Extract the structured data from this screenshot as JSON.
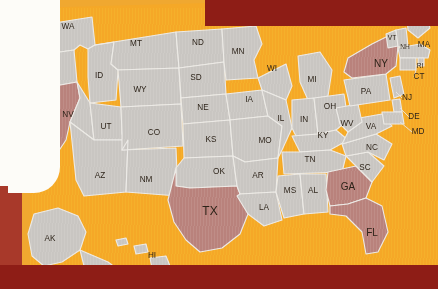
{
  "map": {
    "title": "United States map with highlighted states",
    "colors": {
      "background_orange": "#f5a827",
      "state_fill": "#c9c6c2",
      "state_highlight": "#b9827c",
      "state_border": "#eceae6",
      "frame_red": "#8e1d16",
      "frame_red_left": "#a8392a",
      "panel_white": "#fdfcf8",
      "label_text": "#2b2218"
    },
    "highlighted_states": [
      "CA",
      "TX",
      "NY",
      "GA",
      "FL"
    ],
    "states": [
      {
        "code": "WA",
        "x": 68,
        "y": 27,
        "size": "normal",
        "highlighted": false
      },
      {
        "code": "OR",
        "x": 47,
        "y": 64,
        "size": "normal",
        "highlighted": false
      },
      {
        "code": "CA",
        "x": 45,
        "y": 143,
        "size": "big",
        "highlighted": true
      },
      {
        "code": "NV",
        "x": 68,
        "y": 115,
        "size": "normal",
        "highlighted": false
      },
      {
        "code": "ID",
        "x": 99,
        "y": 76,
        "size": "normal",
        "highlighted": false
      },
      {
        "code": "MT",
        "x": 136,
        "y": 44,
        "size": "normal",
        "highlighted": false
      },
      {
        "code": "WY",
        "x": 140,
        "y": 90,
        "size": "normal",
        "highlighted": false
      },
      {
        "code": "UT",
        "x": 106,
        "y": 127,
        "size": "normal",
        "highlighted": false
      },
      {
        "code": "CO",
        "x": 154,
        "y": 133,
        "size": "normal",
        "highlighted": false
      },
      {
        "code": "AZ",
        "x": 100,
        "y": 176,
        "size": "normal",
        "highlighted": false
      },
      {
        "code": "NM",
        "x": 146,
        "y": 180,
        "size": "normal",
        "highlighted": false
      },
      {
        "code": "ND",
        "x": 198,
        "y": 43,
        "size": "normal",
        "highlighted": false
      },
      {
        "code": "SD",
        "x": 196,
        "y": 78,
        "size": "normal",
        "highlighted": false
      },
      {
        "code": "NE",
        "x": 203,
        "y": 108,
        "size": "normal",
        "highlighted": false
      },
      {
        "code": "KS",
        "x": 211,
        "y": 140,
        "size": "normal",
        "highlighted": false
      },
      {
        "code": "OK",
        "x": 219,
        "y": 172,
        "size": "normal",
        "highlighted": false
      },
      {
        "code": "TX",
        "x": 210,
        "y": 212,
        "size": "big",
        "highlighted": true
      },
      {
        "code": "MN",
        "x": 238,
        "y": 52,
        "size": "normal",
        "highlighted": false
      },
      {
        "code": "IA",
        "x": 249,
        "y": 100,
        "size": "normal",
        "highlighted": false
      },
      {
        "code": "MO",
        "x": 265,
        "y": 141,
        "size": "normal",
        "highlighted": false
      },
      {
        "code": "AR",
        "x": 258,
        "y": 176,
        "size": "normal",
        "highlighted": false
      },
      {
        "code": "LA",
        "x": 264,
        "y": 208,
        "size": "normal",
        "highlighted": false
      },
      {
        "code": "WI",
        "x": 272,
        "y": 69,
        "size": "normal",
        "highlighted": false
      },
      {
        "code": "IL",
        "x": 281,
        "y": 119,
        "size": "normal",
        "highlighted": false
      },
      {
        "code": "MS",
        "x": 290,
        "y": 191,
        "size": "normal",
        "highlighted": false
      },
      {
        "code": "MI",
        "x": 312,
        "y": 80,
        "size": "normal",
        "highlighted": false
      },
      {
        "code": "IN",
        "x": 304,
        "y": 120,
        "size": "normal",
        "highlighted": false
      },
      {
        "code": "OH",
        "x": 330,
        "y": 107,
        "size": "normal",
        "highlighted": false
      },
      {
        "code": "KY",
        "x": 323,
        "y": 136,
        "size": "normal",
        "highlighted": false
      },
      {
        "code": "TN",
        "x": 310,
        "y": 160,
        "size": "normal",
        "highlighted": false
      },
      {
        "code": "AL",
        "x": 313,
        "y": 191,
        "size": "normal",
        "highlighted": false
      },
      {
        "code": "GA",
        "x": 348,
        "y": 187,
        "size": "med",
        "highlighted": true
      },
      {
        "code": "FL",
        "x": 372,
        "y": 233,
        "size": "med",
        "highlighted": true
      },
      {
        "code": "SC",
        "x": 365,
        "y": 168,
        "size": "normal",
        "highlighted": false
      },
      {
        "code": "NC",
        "x": 372,
        "y": 148,
        "size": "normal",
        "highlighted": false
      },
      {
        "code": "VA",
        "x": 371,
        "y": 127,
        "size": "normal",
        "highlighted": false
      },
      {
        "code": "WV",
        "x": 347,
        "y": 124,
        "size": "normal",
        "highlighted": false
      },
      {
        "code": "PA",
        "x": 366,
        "y": 92,
        "size": "normal",
        "highlighted": false
      },
      {
        "code": "NY",
        "x": 381,
        "y": 64,
        "size": "med",
        "highlighted": true
      },
      {
        "code": "VT",
        "x": 392,
        "y": 38,
        "size": "sm",
        "highlighted": false
      },
      {
        "code": "NH",
        "x": 405,
        "y": 47,
        "size": "sm",
        "highlighted": false
      },
      {
        "code": "ME",
        "x": 416,
        "y": 22,
        "size": "normal",
        "highlighted": false
      },
      {
        "code": "MA",
        "x": 424,
        "y": 45,
        "size": "normal",
        "highlighted": false
      },
      {
        "code": "RI",
        "x": 420,
        "y": 66,
        "size": "sm",
        "highlighted": false
      },
      {
        "code": "CT",
        "x": 419,
        "y": 77,
        "size": "normal",
        "highlighted": false
      },
      {
        "code": "NJ",
        "x": 407,
        "y": 98,
        "size": "normal",
        "highlighted": false
      },
      {
        "code": "DE",
        "x": 414,
        "y": 117,
        "size": "normal",
        "highlighted": false
      },
      {
        "code": "MD",
        "x": 418,
        "y": 132,
        "size": "normal",
        "highlighted": false
      },
      {
        "code": "AK",
        "x": 50,
        "y": 239,
        "size": "normal",
        "highlighted": false
      },
      {
        "code": "HI",
        "x": 152,
        "y": 256,
        "size": "normal",
        "highlighted": false
      }
    ]
  }
}
